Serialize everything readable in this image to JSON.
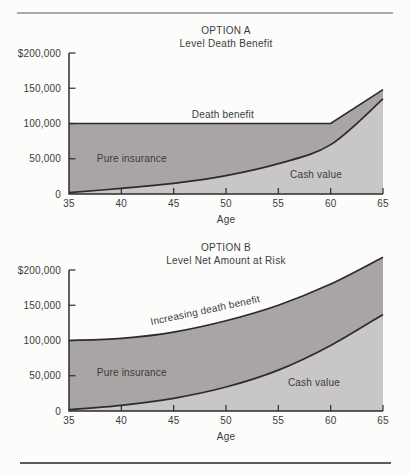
{
  "dividers": {
    "top_color": "#a9a9a9",
    "bottom_color": "#5c5c5c"
  },
  "palette": {
    "dark_area": "#a9a5a5",
    "light_area": "#c9c6c6",
    "line": "#2d2b2b",
    "axis": "#2d2b2b",
    "text": "#3b3b3b"
  },
  "chart_data": [
    {
      "type": "area",
      "title": "OPTION A",
      "subtitle": "Level Death Benefit",
      "xlabel": "Age",
      "x_range": [
        35,
        65
      ],
      "y_range": [
        0,
        200000
      ],
      "x_ticks": [
        35,
        40,
        45,
        50,
        55,
        60,
        65
      ],
      "y_ticks": [
        {
          "value": 200000,
          "label": "$200,000"
        },
        {
          "value": 150000,
          "label": "150,000"
        },
        {
          "value": 100000,
          "label": "100,000"
        },
        {
          "value": 50000,
          "label": "50,000"
        },
        {
          "value": 0,
          "label": "0"
        }
      ],
      "series": [
        {
          "name": "Death benefit",
          "role": "death-benefit",
          "smooth": false,
          "points": [
            [
              35,
              100000
            ],
            [
              60,
              100000
            ],
            [
              65,
              148000
            ]
          ]
        },
        {
          "name": "Cash value",
          "role": "cash-value",
          "smooth": true,
          "points": [
            [
              35,
              2000
            ],
            [
              40,
              8000
            ],
            [
              45,
              15000
            ],
            [
              50,
              26000
            ],
            [
              55,
              43000
            ],
            [
              60,
              70000
            ],
            [
              65,
              135000
            ]
          ]
        }
      ],
      "area_labels": [
        {
          "text": "Death benefit",
          "age": 49.7,
          "value": 113000,
          "rotate": 0
        },
        {
          "text": "Pure insurance",
          "age": 41,
          "value": 51000,
          "rotate": 0
        },
        {
          "text": "Cash value",
          "age": 58.6,
          "value": 27000,
          "rotate": 0
        }
      ]
    },
    {
      "type": "area",
      "title": "OPTION B",
      "subtitle": "Level Net Amount at Risk",
      "xlabel": "Age",
      "x_range": [
        35,
        65
      ],
      "y_range": [
        0,
        200000
      ],
      "x_ticks": [
        35,
        40,
        45,
        50,
        55,
        60,
        65
      ],
      "y_ticks": [
        {
          "value": 200000,
          "label": "$200,000"
        },
        {
          "value": 150000,
          "label": "150,000"
        },
        {
          "value": 100000,
          "label": "100,000"
        },
        {
          "value": 50000,
          "label": "50,000"
        },
        {
          "value": 0,
          "label": "0"
        }
      ],
      "series": [
        {
          "name": "Increasing death benefit",
          "role": "death-benefit",
          "smooth": true,
          "points": [
            [
              35,
              100000
            ],
            [
              40,
              103000
            ],
            [
              45,
              112000
            ],
            [
              50,
              128000
            ],
            [
              55,
              150000
            ],
            [
              60,
              180000
            ],
            [
              65,
              218000
            ]
          ]
        },
        {
          "name": "Cash value",
          "role": "cash-value",
          "smooth": true,
          "points": [
            [
              35,
              2000
            ],
            [
              40,
              8000
            ],
            [
              45,
              18000
            ],
            [
              50,
              34000
            ],
            [
              55,
              58000
            ],
            [
              60,
              93000
            ],
            [
              65,
              137000
            ]
          ]
        }
      ],
      "area_labels": [
        {
          "text": "Increasing death benefit",
          "age": 48,
          "value": 143000,
          "rotate": -12
        },
        {
          "text": "Pure insurance",
          "age": 41,
          "value": 55000,
          "rotate": 0
        },
        {
          "text": "Cash value",
          "age": 58.4,
          "value": 40000,
          "rotate": 0
        }
      ]
    }
  ]
}
